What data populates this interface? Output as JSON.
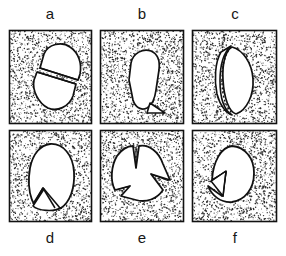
{
  "figure": {
    "type": "scientific-line-drawing",
    "background_color": "#ffffff",
    "ink_color": "#111111",
    "stipple_color": "#2b2b2b",
    "clast_fill_color": "#ffffff",
    "panel_border_color": "#111111",
    "rows": 2,
    "columns": 3
  },
  "panels": [
    {
      "id": "a",
      "label": "a",
      "label_position": "top",
      "x": 9,
      "y": 30,
      "w": 83,
      "h": 94,
      "shape": "oval clast transected by a single straight diagonal fracture splitting it into two offset halves"
    },
    {
      "id": "b",
      "label": "b",
      "label_position": "top",
      "x": 100,
      "y": 30,
      "w": 84,
      "h": 94,
      "shape": "elongate teardrop clast with a small triangular flake detached at the lower right end"
    },
    {
      "id": "c",
      "label": "c",
      "label_position": "top",
      "x": 192,
      "y": 30,
      "w": 85,
      "h": 94,
      "shape": "almond shaped clast with a thin crescentic spall split from the left margin along a dotted parting"
    },
    {
      "id": "d",
      "label": "d",
      "label_position": "bottom",
      "x": 9,
      "y": 130,
      "w": 83,
      "h": 92,
      "shape": "oval clast with a triangular wedge notched into the base"
    },
    {
      "id": "e",
      "label": "e",
      "label_position": "bottom",
      "x": 100,
      "y": 130,
      "w": 84,
      "h": 92,
      "shape": "irregular blocky clast broken by three deep V shaped splits radiating inward"
    },
    {
      "id": "f",
      "label": "f",
      "label_position": "bottom",
      "x": 192,
      "y": 130,
      "w": 85,
      "h": 92,
      "shape": "rounded clast with a narrow wedge sector separated from the lower left margin"
    }
  ],
  "labels": {
    "top": [
      "a",
      "b",
      "c"
    ],
    "bottom": [
      "d",
      "e",
      "f"
    ]
  }
}
